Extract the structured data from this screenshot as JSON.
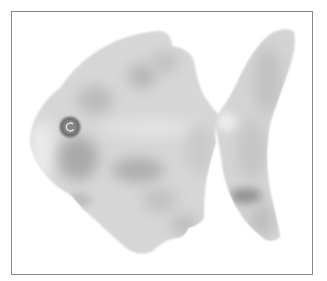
{
  "illustration": {
    "subject": "watercolor fish",
    "style": "grayscale watercolor",
    "colors": {
      "background": "#ffffff",
      "frame": "#8a8a8a",
      "body_light": "#dcdcdc",
      "body_mid": "#c4c4c4",
      "body_dark": "#9e9e9e",
      "eye_ring": "#6e6e6e",
      "eye_center": "#8c8c8c"
    },
    "parts": [
      "body",
      "eye",
      "dorsal-fin",
      "ventral-fin",
      "tail-fin"
    ]
  }
}
